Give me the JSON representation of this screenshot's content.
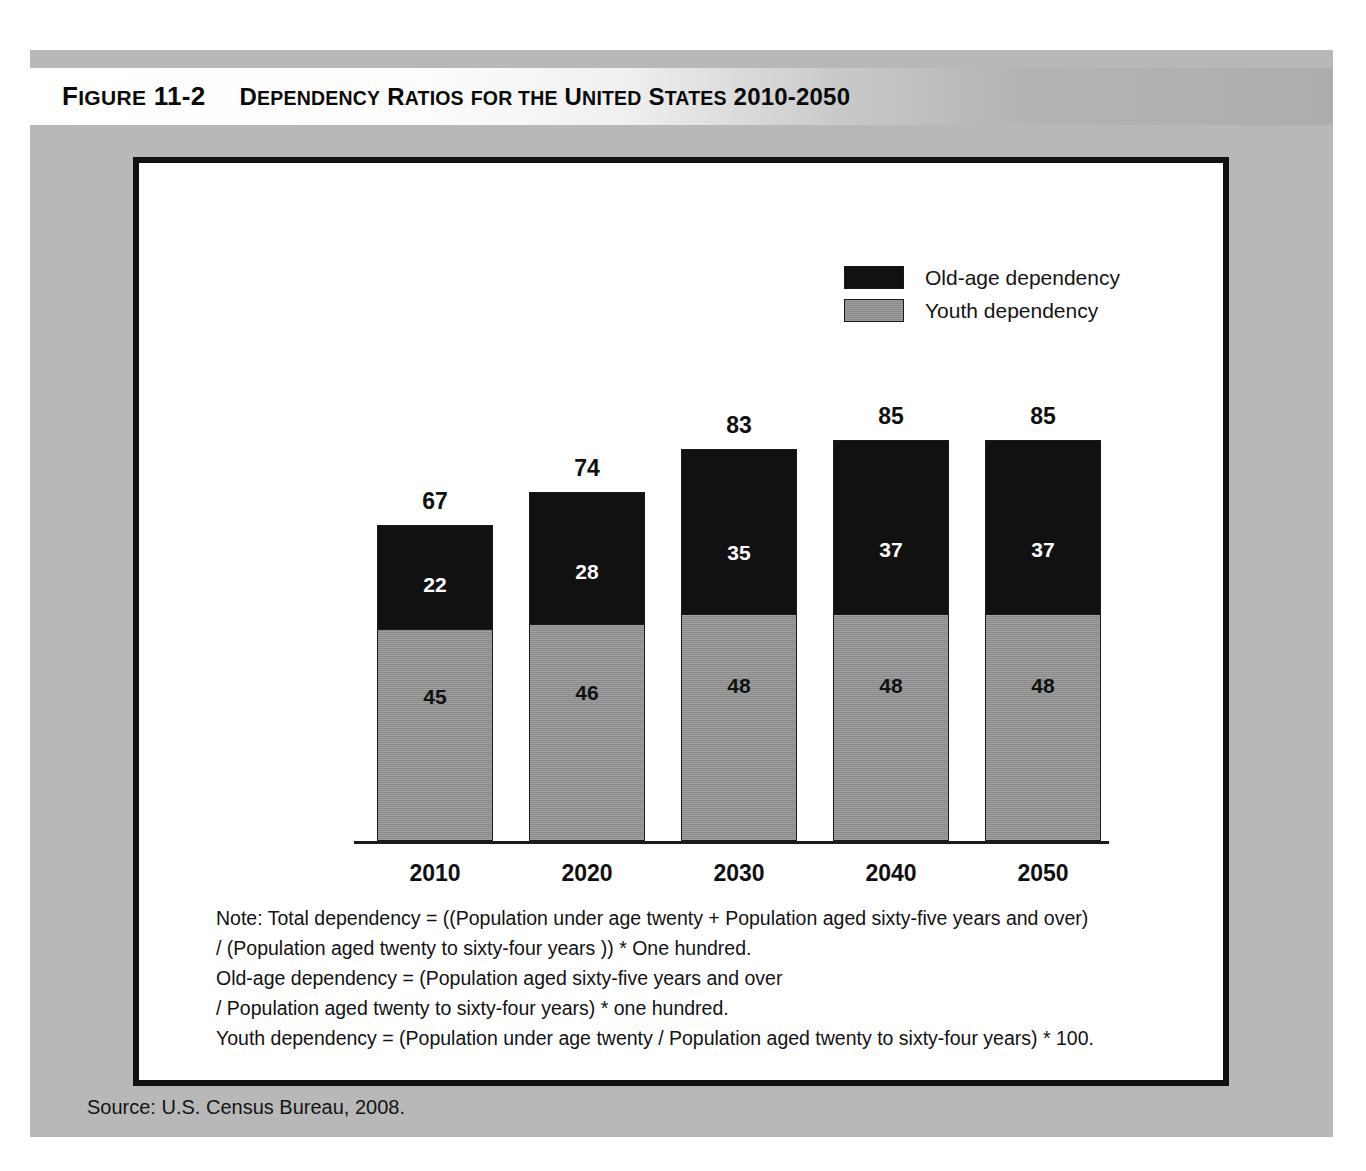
{
  "figure": {
    "number_prefix": "F",
    "number_rest": "IGURE ",
    "number_value": "11-2",
    "title_parts": [
      {
        "t": "D",
        "caps": true
      },
      {
        "t": "EPENDENCY ",
        "caps": false
      },
      {
        "t": "R",
        "caps": true
      },
      {
        "t": "ATIOS FOR THE ",
        "caps": false
      },
      {
        "t": "U",
        "caps": true
      },
      {
        "t": "NITED ",
        "caps": false
      },
      {
        "t": "S",
        "caps": true
      },
      {
        "t": "TATES ",
        "caps": false
      },
      {
        "t": "2010-2050",
        "caps": false
      }
    ],
    "figure_number_text": "FIGURE 11-2",
    "title_text": "DEPENDENCY RATIOS FOR THE UNITED STATES 2010-2050"
  },
  "legend": {
    "position": "top-right",
    "items": [
      {
        "label": "Old-age dependency",
        "color": "#111111",
        "key": "old"
      },
      {
        "label": "Youth dependency",
        "color": "#8a8a8a",
        "key": "youth"
      }
    ]
  },
  "chart_data": {
    "type": "bar",
    "subtype": "stacked",
    "title": "Dependency Ratios for the United States 2010-2050",
    "xlabel": "",
    "ylabel": "",
    "grid": false,
    "legend_position": "top-right",
    "ylim": [
      0,
      100
    ],
    "categories": [
      "2010",
      "2020",
      "2030",
      "2040",
      "2050"
    ],
    "series": [
      {
        "name": "Youth dependency",
        "color": "#8a8a8a",
        "values": [
          45,
          46,
          48,
          48,
          48
        ]
      },
      {
        "name": "Old-age dependency",
        "color": "#111111",
        "values": [
          22,
          28,
          35,
          37,
          37
        ]
      }
    ],
    "totals": [
      67,
      74,
      83,
      85,
      85
    ],
    "total_label": "Total dependency"
  },
  "note": {
    "lines": [
      "Note: Total dependency = ((Population under age twenty + Population aged sixty-five years and over)",
      "/ (Population aged twenty to sixty-four years )) * One hundred.",
      "Old-age dependency = (Population aged sixty-five years and over",
      " / Population aged twenty to sixty-four years) * one hundred.",
      "Youth dependency = (Population under age twenty / Population aged twenty to sixty-four years) * 100."
    ]
  },
  "source": {
    "text": "Source: U.S. Census Bureau, 2008."
  },
  "colors": {
    "panel_gray": "#b8b8b8",
    "old_age": "#111111",
    "youth": "#8a8a8a",
    "frame": "#111111"
  }
}
